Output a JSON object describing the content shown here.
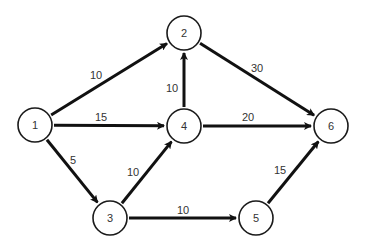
{
  "diagram": {
    "type": "directed-weighted-graph",
    "colors": {
      "stroke": "#111111",
      "node_fill": "#ffffff",
      "text": "#333333",
      "background": "#ffffff"
    },
    "nodes": [
      {
        "id": "1",
        "label": "1",
        "x": 35,
        "y": 125
      },
      {
        "id": "2",
        "label": "2",
        "x": 184,
        "y": 33
      },
      {
        "id": "3",
        "label": "3",
        "x": 110,
        "y": 218
      },
      {
        "id": "4",
        "label": "4",
        "x": 184,
        "y": 126
      },
      {
        "id": "5",
        "label": "5",
        "x": 256,
        "y": 218
      },
      {
        "id": "6",
        "label": "6",
        "x": 331,
        "y": 126
      }
    ],
    "edges": [
      {
        "from": "1",
        "to": "2",
        "weight": "10",
        "lx": 96,
        "ly": 75
      },
      {
        "from": "1",
        "to": "4",
        "weight": "15",
        "lx": 101,
        "ly": 117
      },
      {
        "from": "1",
        "to": "3",
        "weight": "5",
        "lx": 73,
        "ly": 160
      },
      {
        "from": "4",
        "to": "2",
        "weight": "10",
        "lx": 172,
        "ly": 88
      },
      {
        "from": "2",
        "to": "6",
        "weight": "30",
        "lx": 257,
        "ly": 68
      },
      {
        "from": "4",
        "to": "6",
        "weight": "20",
        "lx": 248,
        "ly": 117
      },
      {
        "from": "3",
        "to": "4",
        "weight": "10",
        "lx": 133,
        "ly": 172
      },
      {
        "from": "3",
        "to": "5",
        "weight": "10",
        "lx": 183,
        "ly": 210
      },
      {
        "from": "5",
        "to": "6",
        "weight": "15",
        "lx": 280,
        "ly": 170
      }
    ],
    "node_radius": 17
  }
}
